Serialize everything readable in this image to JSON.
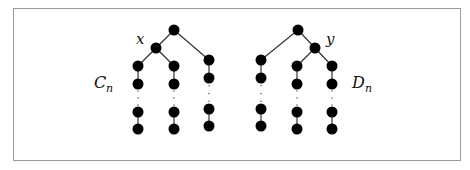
{
  "figure": {
    "labels": {
      "x": "x",
      "y": "y",
      "c_main": "C",
      "c_sub": "n",
      "d_main": "D",
      "d_sub": "n"
    },
    "colors": {
      "node": "#000000",
      "edge": "#333333",
      "frame": "#9a9a9a"
    },
    "trees": [
      {
        "name": "C_n",
        "root": [
          174,
          30
        ],
        "inner": [
          156,
          48
        ],
        "chains": [
          {
            "parent": [
              156,
              48
            ],
            "top": [
              [
                138,
                66
              ],
              [
                138,
                84
              ]
            ],
            "bottom": [
              [
                138,
                112
              ],
              [
                138,
                129
              ]
            ]
          },
          {
            "parent": [
              156,
              48
            ],
            "top": [
              [
                174,
                66
              ],
              [
                174,
                84
              ]
            ],
            "bottom": [
              [
                174,
                112
              ],
              [
                174,
                129
              ]
            ]
          },
          {
            "parent": [
              174,
              30
            ],
            "top": [
              [
                209,
                60
              ],
              [
                209,
                78
              ]
            ],
            "bottom": [
              [
                209,
                109
              ],
              [
                209,
                126
              ]
            ]
          }
        ]
      },
      {
        "name": "D_n",
        "root": [
          298,
          30
        ],
        "inner": [
          315,
          48
        ],
        "chains": [
          {
            "parent": [
              298,
              30
            ],
            "top": [
              [
                261,
                60
              ],
              [
                261,
                78
              ]
            ],
            "bottom": [
              [
                261,
                109
              ],
              [
                261,
                126
              ]
            ]
          },
          {
            "parent": [
              315,
              48
            ],
            "top": [
              [
                297,
                66
              ],
              [
                297,
                84
              ]
            ],
            "bottom": [
              [
                297,
                112
              ],
              [
                297,
                129
              ]
            ]
          },
          {
            "parent": [
              315,
              48
            ],
            "top": [
              [
                332,
                66
              ],
              [
                332,
                84
              ]
            ],
            "bottom": [
              [
                332,
                112
              ],
              [
                332,
                129
              ]
            ]
          }
        ]
      }
    ]
  }
}
